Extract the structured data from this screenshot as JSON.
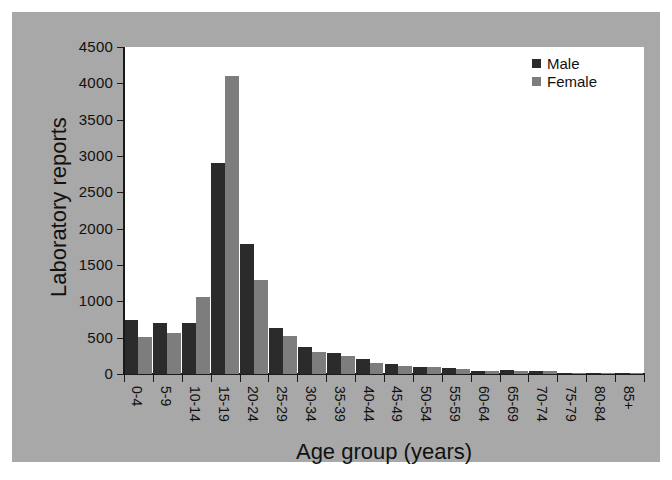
{
  "chart_data": {
    "type": "bar",
    "title": "",
    "xlabel": "Age group (years)",
    "ylabel": "Laboratory reports",
    "ylim": [
      0,
      4500
    ],
    "yticks": [
      0,
      500,
      1000,
      1500,
      2000,
      2500,
      3000,
      3500,
      4000,
      4500
    ],
    "ytick_labels": [
      "0",
      "500",
      "1000",
      "1500",
      "2000",
      "2500",
      "3000",
      "3500",
      "4000",
      "4500"
    ],
    "grid": false,
    "legend_position": "top-right",
    "categories": [
      "0-4",
      "5-9",
      "10-14",
      "15-19",
      "20-24",
      "25-29",
      "30-34",
      "35-39",
      "40-44",
      "45-49",
      "50-54",
      "55-59",
      "60-64",
      "65-69",
      "70-74",
      "75-79",
      "80-84",
      "85+"
    ],
    "series": [
      {
        "name": "Male",
        "color": "#2b2b2b",
        "values": [
          750,
          700,
          700,
          2910,
          1790,
          630,
          370,
          290,
          200,
          140,
          90,
          80,
          45,
          50,
          40,
          15,
          8,
          5
        ]
      },
      {
        "name": "Female",
        "color": "#7d7d7d",
        "values": [
          510,
          560,
          1060,
          4100,
          1290,
          520,
          300,
          250,
          150,
          110,
          100,
          65,
          40,
          45,
          35,
          12,
          6,
          4
        ]
      }
    ]
  },
  "legend": {
    "items": [
      {
        "label": "Male",
        "color": "#2b2b2b"
      },
      {
        "label": "Female",
        "color": "#7d7d7d"
      }
    ]
  },
  "colors": {
    "background": "#ffffff",
    "canvas": "#a8a8a8",
    "plot": "#ffffff",
    "axis": "#1a1a1a",
    "text": "#111111",
    "male": "#2b2b2b",
    "female": "#7d7d7d"
  }
}
